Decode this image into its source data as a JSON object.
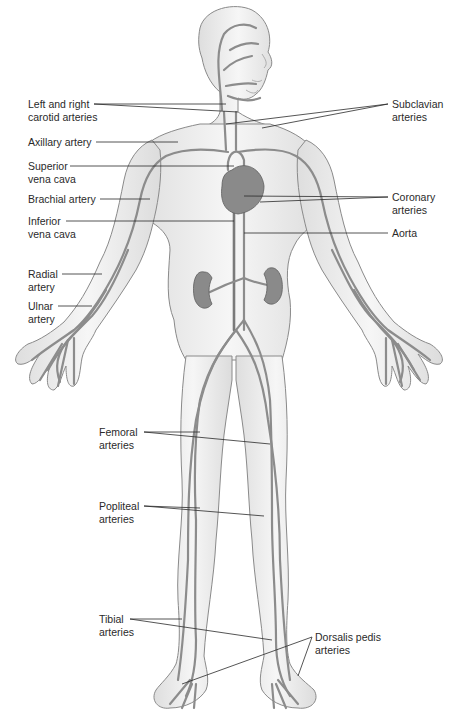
{
  "figure": {
    "colors": {
      "skin_fill": "#eeeeee",
      "skin_outline": "#8a8a8a",
      "vessel": "#8c8c8c",
      "vessel_dark": "#6e6e6e",
      "organ": "#7a7a7a",
      "leader_line": "#2a2a2a",
      "text": "#2a2a2a"
    }
  },
  "labels": {
    "left": [
      {
        "id": "carotid",
        "line1": "Left and right",
        "line2": "carotid arteries"
      },
      {
        "id": "axillary",
        "line1": "Axillary artery",
        "line2": ""
      },
      {
        "id": "superior_vena_cava",
        "line1": "Superior",
        "line2": "vena cava"
      },
      {
        "id": "brachial",
        "line1": "Brachial artery",
        "line2": ""
      },
      {
        "id": "inferior_vena_cava",
        "line1": "Inferior",
        "line2": "vena cava"
      },
      {
        "id": "radial",
        "line1": "Radial",
        "line2": "artery"
      },
      {
        "id": "ulnar",
        "line1": "Ulnar",
        "line2": "artery"
      },
      {
        "id": "femoral",
        "line1": "Femoral",
        "line2": "arteries"
      },
      {
        "id": "popliteal",
        "line1": "Popliteal",
        "line2": "arteries"
      },
      {
        "id": "tibial",
        "line1": "Tibial",
        "line2": "arteries"
      }
    ],
    "right": [
      {
        "id": "subclavian",
        "line1": "Subclavian",
        "line2": "arteries"
      },
      {
        "id": "coronary",
        "line1": "Coronary",
        "line2": "arteries"
      },
      {
        "id": "aorta",
        "line1": "Aorta",
        "line2": ""
      },
      {
        "id": "dorsalis_pedis",
        "line1": "Dorsalis pedis",
        "line2": "arteries"
      }
    ]
  }
}
